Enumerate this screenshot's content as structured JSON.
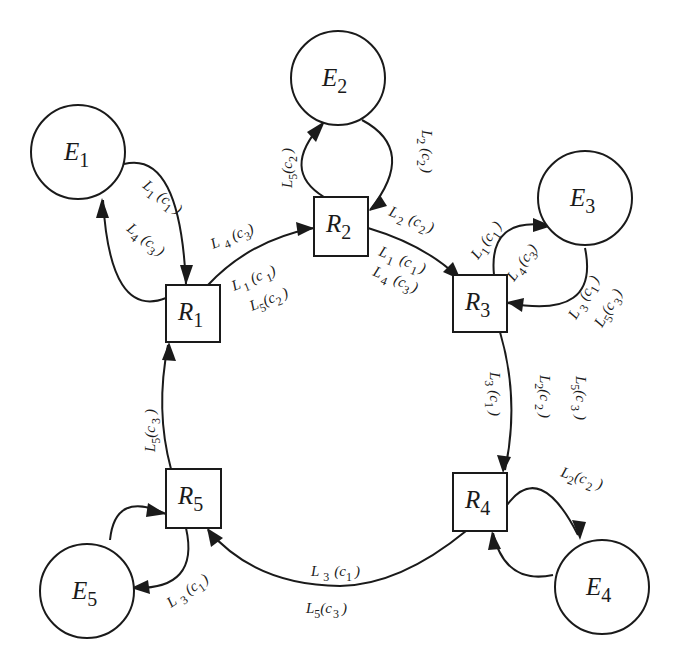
{
  "diagram": {
    "colors": {
      "stroke": "#1a1a1a",
      "background": "#ffffff"
    },
    "external_nodes": [
      {
        "id": "E1",
        "letter": "E",
        "sub": "1"
      },
      {
        "id": "E2",
        "letter": "E",
        "sub": "2"
      },
      {
        "id": "E3",
        "letter": "E",
        "sub": "3"
      },
      {
        "id": "E4",
        "letter": "E",
        "sub": "4"
      },
      {
        "id": "E5",
        "letter": "E",
        "sub": "5"
      }
    ],
    "router_nodes": [
      {
        "id": "R1",
        "letter": "R",
        "sub": "1"
      },
      {
        "id": "R2",
        "letter": "R",
        "sub": "2"
      },
      {
        "id": "R3",
        "letter": "R",
        "sub": "3"
      },
      {
        "id": "R4",
        "letter": "R",
        "sub": "4"
      },
      {
        "id": "R5",
        "letter": "R",
        "sub": "5"
      }
    ],
    "edges": [
      {
        "from": "E1",
        "to": "R1",
        "label": "L1(c1)"
      },
      {
        "from": "R1",
        "to": "E1",
        "label": "L4(c3)"
      },
      {
        "from": "R1",
        "to": "R2",
        "labels": [
          "L4(c3)",
          "L1(c1)",
          "L5(c2)"
        ]
      },
      {
        "from": "R2",
        "to": "E2",
        "label": "L5(c2)"
      },
      {
        "from": "E2",
        "to": "R2",
        "label": "L2(c2)"
      },
      {
        "from": "R2",
        "to": "R3",
        "labels": [
          "L2(c2)",
          "L1(c1)",
          "L4(c3)"
        ]
      },
      {
        "from": "R3",
        "to": "E3",
        "label": "L1(c1)"
      },
      {
        "from": "E3",
        "to": "R3",
        "labels": [
          "L4(c3)",
          "L3(c1)",
          "L5(c3)"
        ]
      },
      {
        "from": "R3",
        "to": "R4",
        "labels": [
          "L3(c1)",
          "L2(c2)",
          "L5(c3)"
        ]
      },
      {
        "from": "R4",
        "to": "E4",
        "label": "L2(c2)"
      },
      {
        "from": "E4",
        "to": "R4",
        "label": ""
      },
      {
        "from": "R4",
        "to": "R5",
        "labels": [
          "L3(c1)",
          "L5(c3)"
        ]
      },
      {
        "from": "R5",
        "to": "E5",
        "label": "L3(c1)"
      },
      {
        "from": "E5",
        "to": "R5",
        "label": ""
      },
      {
        "from": "R5",
        "to": "R1",
        "label": "L5(c3)"
      }
    ],
    "label_parts": {
      "L": "L",
      "c": "c",
      "open": "(",
      "close": ")",
      "n1": "1",
      "n2": "2",
      "n3": "3",
      "n4": "4",
      "n5": "5"
    }
  }
}
